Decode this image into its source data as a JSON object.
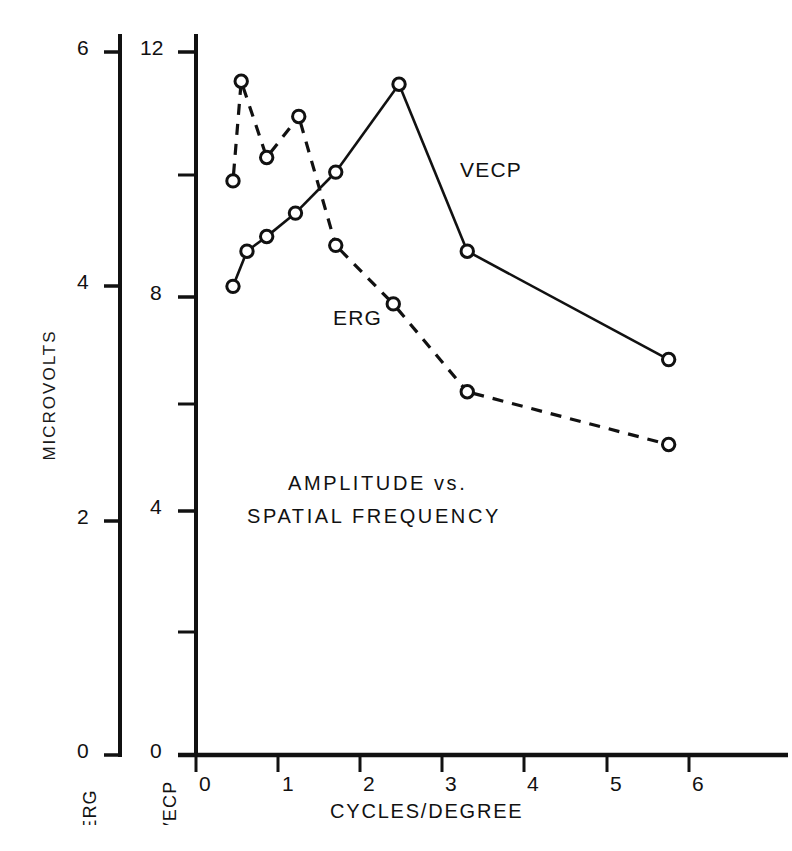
{
  "figure": {
    "title_line1": "AMPLITUDE  vs.",
    "title_line2": "SPATIAL  FREQUENCY",
    "ylabel_outer": "MICROVOLTS",
    "xlabel": "CYCLES/DEGREE",
    "left_axis_name": "ERG",
    "right_axis_name": "VECP",
    "series_label_vecp": "VECP",
    "series_label_erg": "ERG"
  },
  "axes": {
    "erg_ticks": [
      "0",
      "2",
      "4",
      "6"
    ],
    "vecp_ticks": [
      "0",
      "4",
      "8",
      "12"
    ],
    "x_ticks": [
      "0",
      "1",
      "2",
      "3",
      "4",
      "5",
      "6"
    ]
  },
  "chart_data": {
    "type": "line",
    "xlabel": "CYCLES/DEGREE",
    "ylabel": "MICROVOLTS",
    "xlim": [
      0,
      7.3
    ],
    "grid": false,
    "legend": "inline annotations",
    "axes": [
      {
        "name": "ERG",
        "side": "left",
        "ylim": [
          0,
          6
        ],
        "major_ticks": [
          0,
          2,
          4,
          6
        ],
        "minor_ticks": [
          1,
          3,
          5
        ],
        "tick_labels": [
          "0",
          "2",
          "4",
          "6"
        ]
      },
      {
        "name": "VECP",
        "side": "left-inner",
        "ylim": [
          0,
          12
        ],
        "major_ticks": [
          0,
          4,
          8,
          12
        ],
        "minor_ticks": [
          2,
          6,
          10
        ],
        "tick_labels": [
          "0",
          "4",
          "8",
          "12"
        ]
      }
    ],
    "x_major_ticks": [
      0,
      1,
      2,
      3,
      4,
      5,
      6
    ],
    "series": [
      {
        "name": "VECP",
        "axis": "VECP",
        "units": "microvolts",
        "linestyle": "solid",
        "marker": "open-circle",
        "color": "#111111",
        "x": [
          0.45,
          0.62,
          0.86,
          1.21,
          1.7,
          2.47,
          3.3,
          5.75
        ],
        "values": [
          8.0,
          8.6,
          8.85,
          9.25,
          9.95,
          11.45,
          8.6,
          6.75
        ]
      },
      {
        "name": "ERG",
        "axis": "ERG",
        "units": "microvolts",
        "linestyle": "dashed",
        "marker": "open-circle",
        "color": "#111111",
        "x": [
          0.45,
          0.55,
          0.86,
          1.25,
          1.7,
          2.4,
          3.3,
          5.75
        ],
        "values": [
          4.9,
          5.75,
          5.1,
          5.45,
          4.35,
          3.85,
          3.1,
          2.65
        ]
      }
    ],
    "annotations": [
      {
        "text": "VECP",
        "x": 3.25,
        "axis_value": 9.3
      },
      {
        "text": "ERG",
        "x": 1.8,
        "axis_value": 3.05
      },
      {
        "text": "AMPLITUDE  vs.",
        "x": 2.2,
        "axis_value": 5.0
      },
      {
        "text": "SPATIAL  FREQUENCY",
        "x": 1.95,
        "axis_value": 4.55
      }
    ]
  }
}
